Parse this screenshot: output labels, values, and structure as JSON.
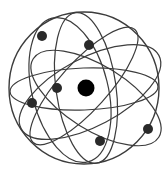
{
  "diagram": {
    "title": "Atom model",
    "colors": {
      "background": "#ffffff",
      "orbit_stroke": "#3c3c3c",
      "nucleus": "#000000",
      "electron": "#2a2a2a"
    },
    "sphere": {
      "cx": 84,
      "cy": 88,
      "rx": 75,
      "ry": 76
    },
    "orbits": [
      {
        "name": "equatorial-orbit",
        "cx": 84,
        "cy": 89,
        "rx": 74,
        "ry": 21,
        "rotate": -2
      },
      {
        "name": "vertical-orbit",
        "cx": 86,
        "cy": 88,
        "rx": 30,
        "ry": 76,
        "rotate": -8
      },
      {
        "name": "tilted-orbit-left-vertical",
        "cx": 70,
        "cy": 90,
        "rx": 38,
        "ry": 74,
        "rotate": -14
      },
      {
        "name": "tilted-orbit-rising",
        "cx": 90,
        "cy": 92,
        "rx": 78,
        "ry": 34,
        "rotate": -28
      },
      {
        "name": "tilted-orbit-falling",
        "cx": 96,
        "cy": 98,
        "rx": 74,
        "ry": 32,
        "rotate": 32
      },
      {
        "name": "diagonal-orbit-narrow",
        "cx": 84,
        "cy": 86,
        "rx": 76,
        "ry": 24,
        "rotate": -48
      }
    ],
    "nucleus": {
      "cx": 86,
      "cy": 88,
      "r": 8.5
    },
    "electrons": [
      {
        "cx": 42,
        "cy": 36,
        "r": 5
      },
      {
        "cx": 89,
        "cy": 45,
        "r": 5
      },
      {
        "cx": 57,
        "cy": 88,
        "r": 5
      },
      {
        "cx": 32,
        "cy": 103,
        "r": 5
      },
      {
        "cx": 100,
        "cy": 141,
        "r": 5
      },
      {
        "cx": 148,
        "cy": 129,
        "r": 5
      }
    ]
  }
}
